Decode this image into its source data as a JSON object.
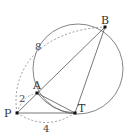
{
  "diagram": {
    "points": {
      "P": {
        "label": "P",
        "x": 17,
        "y": 113
      },
      "A": {
        "label": "A",
        "x": 37,
        "y": 93
      },
      "T": {
        "label": "T",
        "x": 75,
        "y": 113
      },
      "B": {
        "label": "B",
        "x": 105,
        "y": 27
      }
    },
    "circle": {
      "cx": 76,
      "cy": 69,
      "r": 45
    },
    "lengths": {
      "PA": "2",
      "PB": "8",
      "PT": "4"
    },
    "colors": {
      "line": "#555555",
      "dashed": "#888888",
      "point": "#111111"
    }
  }
}
